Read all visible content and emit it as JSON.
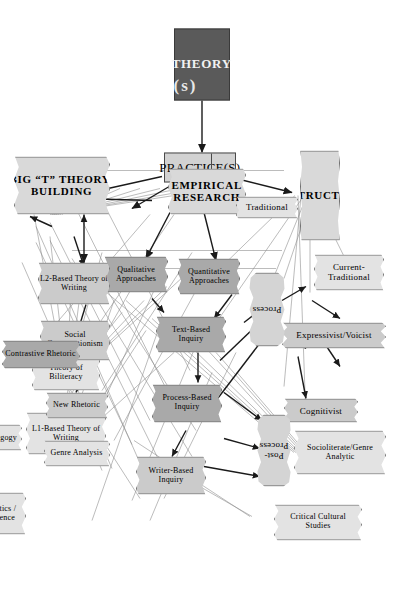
{
  "figure": {
    "colors": {
      "theory_fill": "#5a5a5a",
      "practice_fill": "#d2d2d2",
      "node_light": "#e3e3e3",
      "node_mid": "#cbcbcb",
      "node_dark": "#a9a9a9",
      "line": "#777777",
      "arrow": "#1a1a1a"
    }
  },
  "roots": {
    "theory": "THEORY",
    "theory_suffix": "(s)",
    "practice": "PRACTICE(S)"
  },
  "branches": {
    "instruction": "INSTRUCTION",
    "empirical_research": "EMPIRICAL\nRESEARCH",
    "empirical_research_l1": "EMPIRICAL",
    "empirical_research_l2": "RESEARCH",
    "theory_building_l1": "BIG “T” THEORY-",
    "theory_building_l2": "BUILDING"
  },
  "instruction_nodes": [
    {
      "id": "traditional",
      "label": "Traditional",
      "shade": "light"
    },
    {
      "id": "current-traditional",
      "label": "Current-\nTraditional",
      "l1": "Current-",
      "l2": "Traditional",
      "shade": "light"
    },
    {
      "id": "expressivist-voicist",
      "label": "Expressivist/Voicist",
      "shade": "mid"
    },
    {
      "id": "cognitivist",
      "label": "Cognitivist",
      "shade": "mid"
    },
    {
      "id": "socioliterate-genre-analytic",
      "label": "Socioliterate/Genre\nAnalytic",
      "l1": "Socioliterate/Genre",
      "l2": "Analytic",
      "shade": "light"
    },
    {
      "id": "critical-cultural-studies",
      "label": "Critical Cultural\nStudies",
      "l1": "Critical Cultural",
      "l2": "Studies",
      "shade": "light"
    }
  ],
  "process_blobs": [
    {
      "id": "process",
      "label": "Process"
    },
    {
      "id": "post-process",
      "label": "Post-\nProcess",
      "l1": "Post-",
      "l2": "Process"
    }
  ],
  "research_nodes": [
    {
      "id": "quantitative-approaches",
      "label": "Quantitative\nApproaches",
      "l1": "Quantitative",
      "l2": "Approaches",
      "shade": "dark"
    },
    {
      "id": "qualitative-approaches",
      "label": "Qualitative\nApproaches",
      "l1": "Qualitative",
      "l2": "Approaches",
      "shade": "dark"
    },
    {
      "id": "text-based-inquiry",
      "label": "Text-Based\nInquiry",
      "l1": "Text-Based",
      "l2": "Inquiry",
      "shade": "dark"
    },
    {
      "id": "process-based-inquiry",
      "label": "Process-Based\nInquiry",
      "l1": "Process-Based",
      "l2": "Inquiry",
      "shade": "dark"
    },
    {
      "id": "writer-based-inquiry",
      "label": "Writer-Based\nInquiry",
      "l1": "Writer-Based",
      "l2": "Inquiry",
      "shade": "mid"
    }
  ],
  "theory_nodes": [
    {
      "id": "l1-based-theory-of-writing",
      "label": "L1-Based Theory of\nWriting",
      "l1": "L1-Based Theory of",
      "l2": "Writing",
      "shade": "light"
    },
    {
      "id": "l2-based-theory-of-writing",
      "label": "L2-Based Theory of\nWriting",
      "l1": "L2-Based Theory of",
      "l2": "Writing",
      "shade": "mid"
    },
    {
      "id": "theory-of-biliteracy",
      "label": "Theory of\nBiliteracy",
      "l1": "Theory of",
      "l2": "Biliteracy",
      "shade": "light"
    },
    {
      "id": "social-constructionism",
      "label": "Social\nConstructionism",
      "l1": "Social",
      "l2": "Constructionism",
      "shade": "mid"
    },
    {
      "id": "new-rhetoric",
      "label": "New Rhetoric",
      "shade": "mid"
    },
    {
      "id": "genre-analysis",
      "label": "Genre Analysis",
      "shade": "light"
    },
    {
      "id": "critical-pedagogy",
      "label": "Critical Pedagogy",
      "shade": "light"
    },
    {
      "id": "psycholinguistics-cognitive-science",
      "label": "Psycholinguistics /\nCognitive Science",
      "l1": "Psycholinguistics /",
      "l2": "Cognitive Science",
      "shade": "light"
    },
    {
      "id": "contrastive-rhetoric",
      "label": "Contrastive Rhetoric",
      "shade": "dark"
    }
  ]
}
